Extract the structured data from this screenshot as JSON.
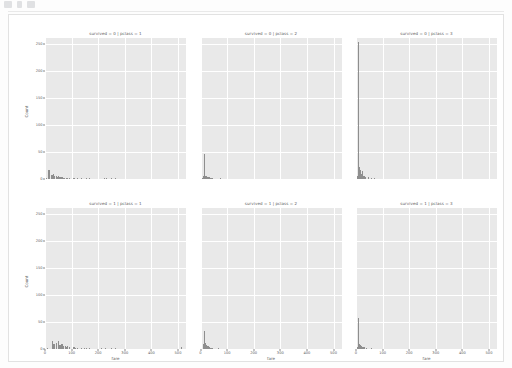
{
  "toolbar": {
    "icons": [
      "toolbar-icon-1",
      "toolbar-icon-2",
      "toolbar-icon-3"
    ]
  },
  "figure": {
    "axis_labels": {
      "x": "fare",
      "y": "Count"
    },
    "xticks": [
      "0",
      "100",
      "200",
      "300",
      "400",
      "500"
    ],
    "yticks": [
      "0",
      "50",
      "100",
      "150",
      "200",
      "250"
    ]
  },
  "chart_data": {
    "type": "bar",
    "title": "",
    "xlabel": "fare",
    "ylabel": "Count",
    "xlim": [
      0,
      530
    ],
    "ylim": [
      0,
      262
    ],
    "grid": true,
    "legend": null,
    "facet_rows": [
      "survived = 0",
      "survived = 1"
    ],
    "facet_cols": [
      "pclass = 1",
      "pclass = 2",
      "pclass = 3"
    ],
    "panels": [
      {
        "title": "survived = 0 | pclass = 1",
        "row": 0,
        "col": 0,
        "bin_centers": [
          5,
          13,
          22,
          27,
          31,
          35,
          40,
          45,
          50,
          53,
          56,
          62,
          67,
          72,
          78,
          83,
          91,
          107,
          120,
          135,
          153,
          164,
          221,
          228,
          247,
          263
        ],
        "values": [
          2,
          16,
          7,
          8,
          9,
          6,
          5,
          4,
          6,
          3,
          4,
          3,
          2,
          2,
          2,
          2,
          1,
          2,
          1,
          1,
          1,
          1,
          1,
          1,
          1,
          1
        ]
      },
      {
        "title": "survived = 0 | pclass = 2",
        "row": 0,
        "col": 1,
        "bin_centers": [
          6,
          10,
          13,
          14,
          16,
          21,
          24,
          26,
          31,
          33,
          37,
          41,
          73
        ],
        "values": [
          2,
          5,
          47,
          9,
          6,
          5,
          4,
          3,
          3,
          2,
          2,
          1,
          1
        ]
      },
      {
        "title": "survived = 0 | pclass = 3",
        "row": 0,
        "col": 2,
        "bin_centers": [
          3,
          7,
          8,
          9,
          12,
          15,
          16,
          18,
          21,
          24,
          27,
          31,
          35,
          46,
          56,
          69
        ],
        "values": [
          6,
          50,
          255,
          40,
          22,
          16,
          12,
          9,
          14,
          7,
          6,
          5,
          4,
          3,
          2,
          1
        ]
      },
      {
        "title": "survived = 1 | pclass = 1",
        "row": 1,
        "col": 0,
        "bin_centers": [
          8,
          26,
          30,
          35,
          40,
          50,
          53,
          57,
          62,
          68,
          76,
          79,
          83,
          90,
          107,
          113,
          120,
          134,
          146,
          153,
          164,
          211,
          227,
          247,
          263,
          512
        ],
        "values": [
          2,
          14,
          10,
          9,
          11,
          14,
          7,
          8,
          9,
          6,
          5,
          4,
          6,
          3,
          3,
          2,
          2,
          2,
          2,
          1,
          2,
          2,
          2,
          1,
          2,
          3
        ]
      },
      {
        "title": "survived = 1 | pclass = 2",
        "row": 1,
        "col": 1,
        "bin_centers": [
          8,
          11,
          13,
          14,
          16,
          21,
          24,
          26,
          30,
          33,
          36,
          41,
          65
        ],
        "values": [
          3,
          9,
          34,
          18,
          12,
          8,
          6,
          5,
          4,
          3,
          2,
          2,
          1
        ]
      },
      {
        "title": "survived = 1 | pclass = 3",
        "row": 1,
        "col": 2,
        "bin_centers": [
          3,
          7,
          8,
          9,
          11,
          13,
          16,
          19,
          22,
          25,
          31,
          39,
          56
        ],
        "values": [
          4,
          14,
          57,
          18,
          9,
          7,
          6,
          5,
          4,
          3,
          3,
          2,
          1
        ]
      }
    ]
  }
}
